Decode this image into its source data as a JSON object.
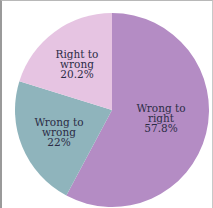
{
  "chart_data": {
    "type": "pie",
    "title": "",
    "start_angle_deg": 0,
    "direction": "clockwise",
    "slices": [
      {
        "name": "Wrong to right",
        "label_lines": [
          "Wrong to",
          "right",
          "57.8%"
        ],
        "value": 57.8,
        "color": "#b48cc4"
      },
      {
        "name": "Wrong to wrong",
        "label_lines": [
          "Wrong to",
          "wrong",
          "22%"
        ],
        "value": 22,
        "color": "#8fb4bc"
      },
      {
        "name": "Right to wrong",
        "label_lines": [
          "Right to",
          "wrong",
          "20.2%"
        ],
        "value": 20.2,
        "color": "#e6c4e2"
      }
    ],
    "legend": "none",
    "labels_inside": true
  },
  "text_color": "#2c2c46"
}
